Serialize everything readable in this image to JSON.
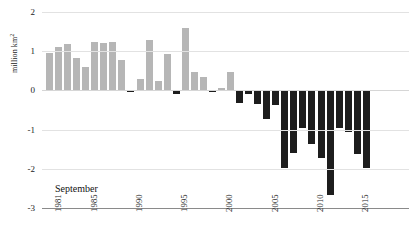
{
  "chart_data": {
    "type": "bar",
    "title": "",
    "subtitle": "",
    "annotation": "September",
    "xlabel": "",
    "ylabel": "million km²",
    "ylabel_unit_base": "million km",
    "ylabel_unit_exponent": "2",
    "ylim": [
      -3,
      2
    ],
    "yticks": [
      2,
      1,
      0,
      -1,
      -2,
      -3
    ],
    "ytick_labels": [
      "2",
      "1",
      "0",
      "-1",
      "-2",
      "-3"
    ],
    "grid": true,
    "legend": "none",
    "xtick_labels": [
      "1981",
      "1985",
      "1990",
      "1995",
      "2000",
      "2005",
      "2010",
      "2015"
    ],
    "xtick_years": [
      1981,
      1985,
      1990,
      1995,
      2000,
      2005,
      2010,
      2015
    ],
    "colors": {
      "positive_bar": "#b6b6b6",
      "negative_bar": "#1d1d1d",
      "gridline": "#e2e2e2",
      "axis_line": "#8a8a8a",
      "text": "#1b1b1b"
    },
    "categories": [
      "1981",
      "1982",
      "1983",
      "1984",
      "1985",
      "1986",
      "1987",
      "1988",
      "1989",
      "1990",
      "1991",
      "1992",
      "1993",
      "1994",
      "1995",
      "1996",
      "1997",
      "1998",
      "1999",
      "2000",
      "2001",
      "2002",
      "2003",
      "2004",
      "2005",
      "2006",
      "2007",
      "2008",
      "2009",
      "2010",
      "2011",
      "2012",
      "2013",
      "2014",
      "2015",
      "2016"
    ],
    "values": [
      0.95,
      1.1,
      1.19,
      0.82,
      0.6,
      1.24,
      1.2,
      1.24,
      0.77,
      -0.03,
      0.3,
      1.29,
      0.25,
      0.94,
      -0.1,
      1.6,
      0.46,
      0.35,
      -0.03,
      0.07,
      0.47,
      -0.32,
      -0.1,
      -0.35,
      -0.73,
      -0.38,
      -1.98,
      -1.6,
      -0.95,
      -1.38,
      -1.72,
      -2.68,
      -0.95,
      -1.05,
      -1.62,
      -1.98
    ]
  }
}
